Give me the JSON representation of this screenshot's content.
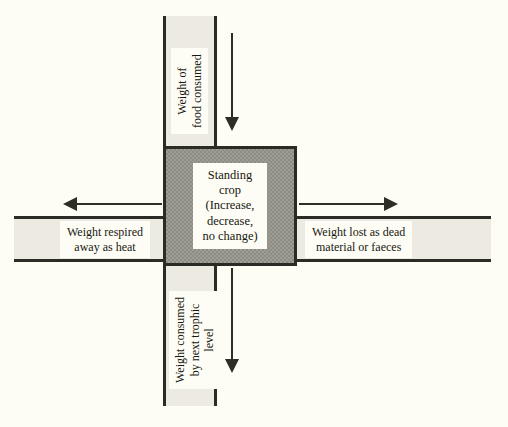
{
  "diagram": {
    "type": "energy-flow-cross",
    "center": {
      "label": "Standing\ncrop\n(Increase,\ndecrease,\nno change)",
      "fill_color": "#8d8d84",
      "border_color": "#2b2b26"
    },
    "arms": [
      {
        "id": "top",
        "name": "weight-of-food-consumed",
        "label": "Weight of\nfood consumed",
        "orientation": "vertical",
        "arrow_direction": "down",
        "band_color": "#eceae1"
      },
      {
        "id": "left",
        "name": "weight-respired-away-as-heat",
        "label": "Weight respired\naway as heat",
        "orientation": "horizontal",
        "arrow_direction": "left",
        "band_color": "#eceae1"
      },
      {
        "id": "right",
        "name": "weight-lost-as-dead-material-or-faeces",
        "label": "Weight lost as dead\nmaterial or faeces",
        "orientation": "horizontal",
        "arrow_direction": "right",
        "band_color": "#eceae1"
      },
      {
        "id": "bottom",
        "name": "weight-consumed-by-next-trophic-level",
        "label": "Weight consumed\nby next trophic\nlevel",
        "orientation": "vertical",
        "arrow_direction": "down",
        "band_color": "#eceae1"
      }
    ],
    "background_color": "#fefdf4",
    "line_color": "#2e2e27"
  }
}
